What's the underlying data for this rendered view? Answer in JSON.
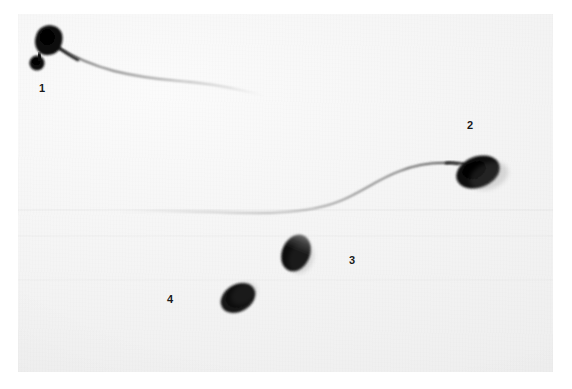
{
  "figure": {
    "kind": "light-micrograph",
    "background_color": "#ffffff",
    "plate_color": "#f3f3f3",
    "ink_color": "#111111",
    "caption": ""
  },
  "plate": {
    "x": 18,
    "y": 14,
    "width": 535,
    "height": 358
  },
  "labels": [
    {
      "id": "label-1",
      "text": "1",
      "x": 39,
      "y": 83,
      "refers_to": "cell-1"
    },
    {
      "id": "label-2",
      "text": "2",
      "x": 467,
      "y": 120,
      "refers_to": "cell-2"
    },
    {
      "id": "label-3",
      "text": "3",
      "x": 349,
      "y": 255,
      "refers_to": "cell-3"
    },
    {
      "id": "label-4",
      "text": "4",
      "x": 167,
      "y": 294,
      "refers_to": "cell-4"
    }
  ],
  "cells": [
    {
      "id": "cell-1",
      "number": "1",
      "description": "spermatozoon with large rounded head, proximal cytoplasmic droplet and full tail",
      "head": {
        "cx": 45,
        "cy": 42,
        "rx": 14,
        "ry": 13,
        "rotation": -12
      },
      "droplet": {
        "cx": 37,
        "cy": 63,
        "rx": 8,
        "ry": 8
      },
      "tail": {
        "start_x": 58,
        "start_y": 47,
        "end_x": 266,
        "end_y": 96,
        "visible": true
      }
    },
    {
      "id": "cell-2",
      "number": "2",
      "description": "spermatozoon with oval head and long sweeping tail",
      "head": {
        "cx": 478,
        "cy": 172,
        "rx": 23,
        "ry": 16,
        "rotation": -22
      },
      "droplet": null,
      "tail": {
        "start_x": 455,
        "start_y": 163,
        "end_x": 112,
        "end_y": 212,
        "visible": true
      }
    },
    {
      "id": "cell-3",
      "number": "3",
      "description": "detached sperm head, oval, with pale apical region",
      "head": {
        "cx": 296,
        "cy": 253,
        "rx": 14,
        "ry": 19,
        "rotation": 22
      },
      "droplet": null,
      "tail": {
        "visible": false
      }
    },
    {
      "id": "cell-4",
      "number": "4",
      "description": "detached sperm head, oval, obliquely oriented",
      "head": {
        "cx": 238,
        "cy": 298,
        "rx": 19,
        "ry": 14,
        "rotation": -32
      },
      "droplet": null,
      "tail": {
        "visible": false
      }
    }
  ]
}
